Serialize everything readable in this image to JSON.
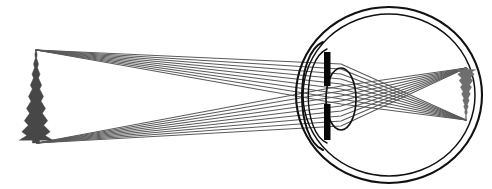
{
  "figure": {
    "title": "Formation of an inverted retinal image by the human eye",
    "type": "optics-ray-diagram",
    "width": 492,
    "height": 189,
    "background_color": "#ffffff"
  },
  "colors": {
    "ray": "#5a5a5a",
    "object_tree": "#474747",
    "image_tree": "#6e6e6e",
    "eye_outline": "#111111",
    "iris": "#080808",
    "lens_outline": "#111111",
    "cornea": "#111111",
    "background": "#ffffff"
  },
  "object": {
    "name": "pine-tree-object",
    "label": "Pine tree (object)",
    "x": 36,
    "top_y": 50,
    "base_y": 143,
    "height_px": 93,
    "orientation": "upright"
  },
  "image": {
    "name": "retinal-image",
    "label": "Inverted pine tree image on retina",
    "x": 466,
    "top_y": 120,
    "base_y": 68,
    "height_px": 52,
    "orientation": "inverted"
  },
  "eye": {
    "label": "Human eye (cross section)",
    "center_x": 389,
    "center_y": 95,
    "sclera": {
      "label": "Sclera (outer coat)",
      "rx": 93,
      "ry": 88,
      "stroke_width": 2.1
    },
    "retina": {
      "label": "Retina (inner coat)",
      "rx": 86,
      "ry": 81,
      "stroke_width": 1.5
    },
    "cornea": {
      "label": "Cornea",
      "apex_x": 297,
      "top_y": 42,
      "bottom_y": 150
    },
    "iris": {
      "label": "Iris",
      "x": 324,
      "width": 6.5,
      "top_y": 52,
      "bottom_y": 140,
      "pupil_gap_top": 86,
      "pupil_gap_bottom": 104,
      "pupil_label": "Pupil"
    },
    "lens": {
      "label": "Crystalline lens",
      "center_x": 341,
      "center_y": 99,
      "rx": 15,
      "ry": 31,
      "stroke_width": 1.7
    }
  },
  "ray_bundles": [
    {
      "name": "upper-ray-bundle",
      "label": "Rays from treetop to lower retina",
      "origin_x": 36,
      "origin_y": 50,
      "focus_x": 466,
      "focus_y": 120,
      "ray_count": 9,
      "pupil_span_top": 64,
      "pupil_span_bottom": 104
    },
    {
      "name": "lower-ray-bundle",
      "label": "Rays from tree base to upper retina",
      "origin_x": 37,
      "origin_y": 143,
      "focus_x": 466,
      "focus_y": 68,
      "ray_count": 9,
      "pupil_span_top": 86,
      "pupil_span_bottom": 126
    }
  ],
  "tree_profile": {
    "description": "Conifer silhouette half-width offsets used for both object and image trees",
    "trunk_width_ratio": 0.055,
    "tiers": [
      {
        "t": 0.0,
        "w": 0.02
      },
      {
        "t": 0.05,
        "w": 0.07
      },
      {
        "t": 0.09,
        "w": 0.04
      },
      {
        "t": 0.15,
        "w": 0.15
      },
      {
        "t": 0.19,
        "w": 0.09
      },
      {
        "t": 0.26,
        "w": 0.24
      },
      {
        "t": 0.3,
        "w": 0.15
      },
      {
        "t": 0.38,
        "w": 0.34
      },
      {
        "t": 0.42,
        "w": 0.22
      },
      {
        "t": 0.5,
        "w": 0.45
      },
      {
        "t": 0.55,
        "w": 0.3
      },
      {
        "t": 0.63,
        "w": 0.57
      },
      {
        "t": 0.68,
        "w": 0.38
      },
      {
        "t": 0.76,
        "w": 0.7
      },
      {
        "t": 0.81,
        "w": 0.46
      },
      {
        "t": 0.88,
        "w": 0.85
      },
      {
        "t": 0.92,
        "w": 0.55
      },
      {
        "t": 0.97,
        "w": 1.0
      }
    ]
  }
}
